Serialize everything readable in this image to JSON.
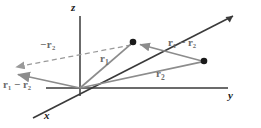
{
  "figure": {
    "width": 261,
    "height": 128,
    "background_color": "#ffffff",
    "axis_color": "#3a3a3a",
    "vector_color": "#8c8c8c",
    "dashed_color": "#a0a0a0",
    "point_color": "#1a1a1a",
    "label_color": "#6b6b6b",
    "axis_label_color": "#1a1a1a"
  },
  "axes": {
    "z": {
      "label": "z",
      "from": [
        80,
        88
      ],
      "to": [
        80,
        14
      ]
    },
    "y": {
      "label": "y",
      "from": [
        80,
        88
      ],
      "to": [
        228,
        88
      ]
    },
    "x": {
      "label": "x",
      "from": [
        80,
        88
      ],
      "to": [
        36,
        116
      ],
      "to_positive": [
        232,
        15
      ]
    }
  },
  "axis_labels": [
    {
      "name": "z",
      "text": "z",
      "x": 72,
      "y": 3
    },
    {
      "name": "y",
      "text": "y",
      "x": 228,
      "y": 90
    },
    {
      "name": "x",
      "text": "x",
      "x": 44,
      "y": 112
    }
  ],
  "origin": [
    80,
    88
  ],
  "points": [
    {
      "name": "point-1",
      "x": 133,
      "y": 42,
      "radius": 3.2
    },
    {
      "name": "point-2",
      "x": 204,
      "y": 61,
      "radius": 3.2
    }
  ],
  "vectors": [
    {
      "name": "r1",
      "label": "r",
      "subscript": "1",
      "from": [
        80,
        88
      ],
      "to": [
        133,
        42
      ],
      "style": "solid",
      "label_x": 103,
      "label_y": 55
    },
    {
      "name": "r2",
      "label": "r",
      "subscript": "2",
      "from": [
        80,
        88
      ],
      "to": [
        204,
        61
      ],
      "style": "solid",
      "label_x": 157,
      "label_y": 70
    },
    {
      "name": "r1-minus-r2-right",
      "label": "r",
      "subscript": "1",
      "label2": "r",
      "subscript2": "2",
      "minus": "−",
      "from": [
        204,
        61
      ],
      "to": [
        133,
        42
      ],
      "style": "solid",
      "label_x": 170,
      "label_y": 39
    },
    {
      "name": "r1-minus-r2-left",
      "label": "r",
      "subscript": "1",
      "label2": "r",
      "subscript2": "2",
      "minus": "−",
      "from": [
        80,
        88
      ],
      "to": [
        11,
        73
      ],
      "style": "solid",
      "label_x": 4,
      "label_y": 80
    },
    {
      "name": "minus-r2",
      "label": "r",
      "subscript": "2",
      "minus": "−",
      "from": [
        133,
        44
      ],
      "to": [
        9,
        68
      ],
      "style": "dashed",
      "label_x": 42,
      "label_y": 42
    }
  ],
  "vector_labels": {
    "r1": {
      "base": "r",
      "sub": "1"
    },
    "r2": {
      "base": "r",
      "sub": "2"
    },
    "r1_minus_r2_right": {
      "text": "r₁ − r₂"
    },
    "r1_minus_r2_left": {
      "text": "r₁ − r₂"
    },
    "minus_r2": {
      "text": "−r₂"
    }
  }
}
